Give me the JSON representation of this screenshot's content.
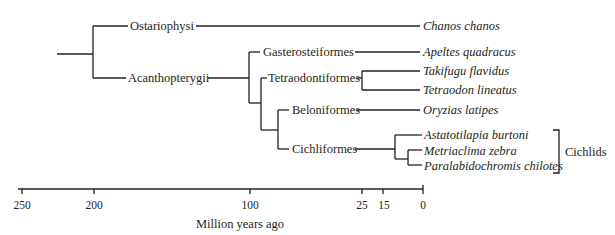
{
  "tree": {
    "clades": {
      "ostariophysi": "Ostariophysi",
      "acanthopterygii": "Acanthopterygii",
      "gasterosteiformes": "Gasterosteiformes",
      "tetraodontiformes": "Tetraodontiformes",
      "beloniformes": "Beloniformes",
      "cichliformes": "Cichliformes"
    },
    "species": [
      "Chanos chanos",
      "Apeltes quadracus",
      "Takifugu flavidus",
      "Tetraodon lineatus",
      "Oryzias latipes",
      "Astatotilapia burtoni",
      "Metriaclima zebra",
      "Paralabidochromis chilotes"
    ],
    "group_bracket_label": "Cichlids"
  },
  "axis": {
    "ticks": [
      "250",
      "200",
      "100",
      "25",
      "15",
      "0"
    ],
    "label": "Million years ago"
  }
}
